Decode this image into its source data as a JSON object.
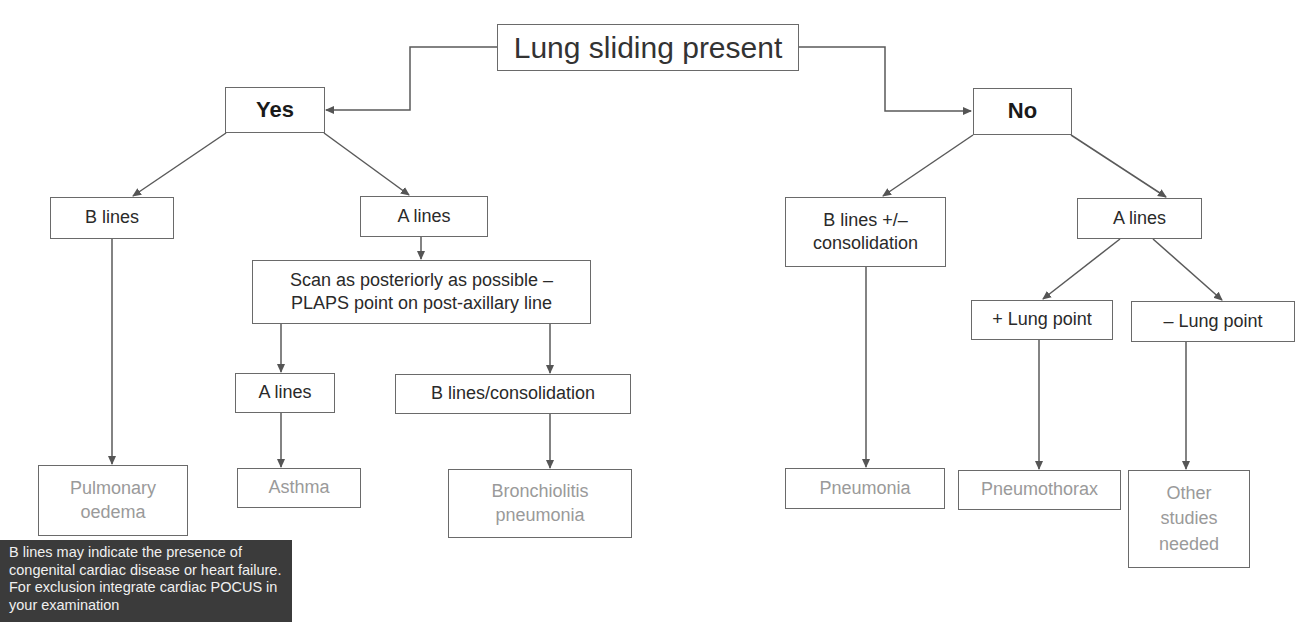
{
  "diagram": {
    "type": "flowchart",
    "title": "Lung sliding present",
    "colors": {
      "line": "#5a5a5a",
      "node_border": "#6a6a6a",
      "outcome_text": "#9a9a9a",
      "note_background": "#3b3b3b",
      "note_text": "#f0f0f0"
    },
    "nodes": {
      "root": "Lung sliding present",
      "yes": "Yes",
      "no": "No",
      "yes_b_lines": "B lines",
      "yes_a_lines": "A lines",
      "scan_posterior": "Scan as posteriorly as possible –\nPLAPS point on post-axillary line",
      "plaps_a_lines": "A lines",
      "plaps_b_lines_consolidation": "B lines/consolidation",
      "pulmonary_oedema": "Pulmonary\noedema",
      "asthma": "Asthma",
      "bronchiolitis_pneumonia": "Bronchiolitis\npneumonia",
      "no_b_lines_consolidation": "B lines +/–\nconsolidation",
      "no_a_lines": "A lines",
      "plus_lung_point": "+ Lung point",
      "minus_lung_point": "– Lung point",
      "pneumonia": "Pneumonia",
      "pneumothorax": "Pneumothorax",
      "other_studies": "Other\nstudies\nneeded"
    },
    "edges": [
      [
        "root",
        "yes"
      ],
      [
        "root",
        "no"
      ],
      [
        "yes",
        "yes_b_lines"
      ],
      [
        "yes",
        "yes_a_lines"
      ],
      [
        "yes_b_lines",
        "pulmonary_oedema"
      ],
      [
        "yes_a_lines",
        "scan_posterior"
      ],
      [
        "scan_posterior",
        "plaps_a_lines"
      ],
      [
        "scan_posterior",
        "plaps_b_lines_consolidation"
      ],
      [
        "plaps_a_lines",
        "asthma"
      ],
      [
        "plaps_b_lines_consolidation",
        "bronchiolitis_pneumonia"
      ],
      [
        "no",
        "no_b_lines_consolidation"
      ],
      [
        "no",
        "no_a_lines"
      ],
      [
        "no_b_lines_consolidation",
        "pneumonia"
      ],
      [
        "no_a_lines",
        "plus_lung_point"
      ],
      [
        "no_a_lines",
        "minus_lung_point"
      ],
      [
        "plus_lung_point",
        "pneumothorax"
      ],
      [
        "minus_lung_point",
        "other_studies"
      ]
    ],
    "note": "B lines may indicate the presence of congenital cardiac disease or heart failure. For exclusion integrate cardiac POCUS in your examination"
  }
}
